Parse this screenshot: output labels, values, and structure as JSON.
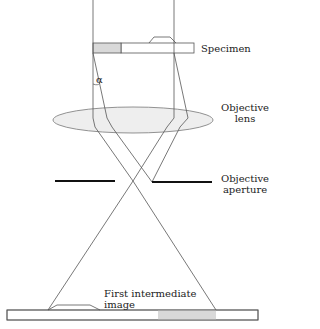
{
  "diagram": {
    "type": "optical ray diagram",
    "labels": {
      "specimen": "Specimen",
      "objective_lens_line1": "Objective",
      "objective_lens_line2": "lens",
      "objective_aperture_line1": "Objective",
      "objective_aperture_line2": "aperture",
      "first_image_line1": "First intermediate",
      "first_image_line2": "image",
      "angle": "α"
    },
    "colors": {
      "line": "#555555",
      "shade": "#d9d9d9",
      "lens_fill": "#eeeeee",
      "aperture": "#111111"
    }
  }
}
